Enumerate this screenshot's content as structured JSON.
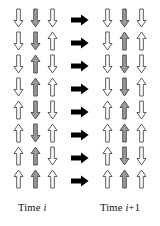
{
  "figure": {
    "type": "cellular-automaton-arrow-grid",
    "rows": 8,
    "columns": 3,
    "colors": {
      "arrow_outline": "#4a4a4a",
      "arrow_fill_white": "#ffffff",
      "arrow_fill_gray": "#9a9a9a",
      "transition_arrow": "#000000",
      "background": "#ffffff",
      "text": "#111111"
    },
    "labels": {
      "left": "Time ",
      "left_italic": "i",
      "left_suffix": "",
      "right": "Time ",
      "right_italic": "i",
      "right_suffix": "+1"
    },
    "icons": {
      "arrow_up": "arrow-up-icon",
      "arrow_down": "arrow-down-icon",
      "arrow_right": "arrow-right-icon"
    },
    "transition_arrow_count": 8,
    "left_grid": [
      [
        {
          "dir": "down",
          "fill": "white"
        },
        {
          "dir": "down",
          "fill": "gray"
        },
        {
          "dir": "down",
          "fill": "white"
        }
      ],
      [
        {
          "dir": "down",
          "fill": "white"
        },
        {
          "dir": "down",
          "fill": "gray"
        },
        {
          "dir": "up",
          "fill": "white"
        }
      ],
      [
        {
          "dir": "down",
          "fill": "white"
        },
        {
          "dir": "up",
          "fill": "gray"
        },
        {
          "dir": "down",
          "fill": "white"
        }
      ],
      [
        {
          "dir": "down",
          "fill": "white"
        },
        {
          "dir": "up",
          "fill": "gray"
        },
        {
          "dir": "up",
          "fill": "white"
        }
      ],
      [
        {
          "dir": "up",
          "fill": "white"
        },
        {
          "dir": "down",
          "fill": "gray"
        },
        {
          "dir": "down",
          "fill": "white"
        }
      ],
      [
        {
          "dir": "up",
          "fill": "white"
        },
        {
          "dir": "down",
          "fill": "gray"
        },
        {
          "dir": "up",
          "fill": "white"
        }
      ],
      [
        {
          "dir": "up",
          "fill": "white"
        },
        {
          "dir": "up",
          "fill": "gray"
        },
        {
          "dir": "down",
          "fill": "white"
        }
      ],
      [
        {
          "dir": "up",
          "fill": "white"
        },
        {
          "dir": "up",
          "fill": "gray"
        },
        {
          "dir": "up",
          "fill": "white"
        }
      ]
    ],
    "right_grid": [
      [
        {
          "dir": "down",
          "fill": "white"
        },
        {
          "dir": "down",
          "fill": "gray"
        },
        {
          "dir": "down",
          "fill": "white"
        }
      ],
      [
        {
          "dir": "down",
          "fill": "white"
        },
        {
          "dir": "up",
          "fill": "gray"
        },
        {
          "dir": "up",
          "fill": "white"
        }
      ],
      [
        {
          "dir": "down",
          "fill": "white"
        },
        {
          "dir": "down",
          "fill": "gray"
        },
        {
          "dir": "down",
          "fill": "white"
        }
      ],
      [
        {
          "dir": "down",
          "fill": "white"
        },
        {
          "dir": "down",
          "fill": "gray"
        },
        {
          "dir": "up",
          "fill": "white"
        }
      ],
      [
        {
          "dir": "up",
          "fill": "white"
        },
        {
          "dir": "up",
          "fill": "gray"
        },
        {
          "dir": "down",
          "fill": "white"
        }
      ],
      [
        {
          "dir": "up",
          "fill": "white"
        },
        {
          "dir": "up",
          "fill": "gray"
        },
        {
          "dir": "up",
          "fill": "white"
        }
      ],
      [
        {
          "dir": "up",
          "fill": "white"
        },
        {
          "dir": "down",
          "fill": "gray"
        },
        {
          "dir": "down",
          "fill": "white"
        }
      ],
      [
        {
          "dir": "up",
          "fill": "white"
        },
        {
          "dir": "up",
          "fill": "gray"
        },
        {
          "dir": "up",
          "fill": "white"
        }
      ]
    ]
  }
}
